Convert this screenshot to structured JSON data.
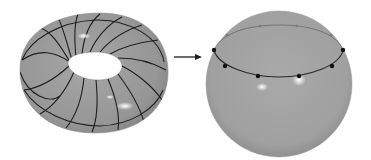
{
  "figure": {
    "colors": {
      "surface": "#9a9a9a",
      "surface_dark": "#7e7e7e",
      "curve": "#1e1e1e",
      "highlight": "#ffffff",
      "background": "#ffffff"
    },
    "torus": {
      "curve_count": 16
    },
    "arrow": {
      "direction": "right"
    },
    "sphere": {
      "circle_points_front": 6,
      "circle_points_back": 4
    }
  }
}
